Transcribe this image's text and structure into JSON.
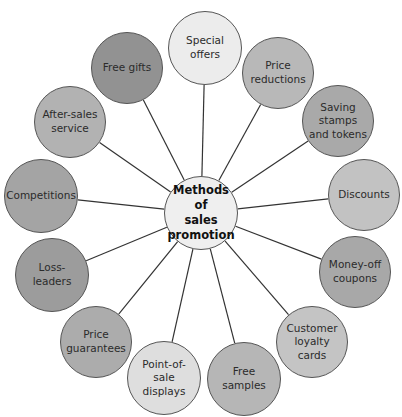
{
  "diagram": {
    "title": "Methods of sales promotion",
    "center": {
      "label": "Methods of\nsales\npromotion",
      "x": 201,
      "y": 213,
      "r": 37,
      "fill": "#efefef"
    },
    "nodes": [
      {
        "label": "Special offers",
        "x": 205,
        "y": 48,
        "r": 37,
        "fill": "#ececec"
      },
      {
        "label": "Price\nreductions",
        "x": 278,
        "y": 73,
        "r": 36,
        "fill": "#b8b8b8"
      },
      {
        "label": "Saving stamps\nand tokens",
        "x": 338,
        "y": 121,
        "r": 36,
        "fill": "#a9a9a9"
      },
      {
        "label": "Discounts",
        "x": 364,
        "y": 195,
        "r": 36,
        "fill": "#c2c2c2"
      },
      {
        "label": "Money-off\ncoupons",
        "x": 355,
        "y": 272,
        "r": 36,
        "fill": "#a8a8a8"
      },
      {
        "label": "Customer\nloyalty cards",
        "x": 312,
        "y": 342,
        "r": 36,
        "fill": "#c4c4c4"
      },
      {
        "label": "Free samples",
        "x": 244,
        "y": 379,
        "r": 37,
        "fill": "#b6b6b6"
      },
      {
        "label": "Point-of-sale\ndisplays",
        "x": 164,
        "y": 378,
        "r": 37,
        "fill": "#dedede"
      },
      {
        "label": "Price\nguarantees",
        "x": 96,
        "y": 342,
        "r": 36,
        "fill": "#acacac"
      },
      {
        "label": "Loss-leaders",
        "x": 52,
        "y": 275,
        "r": 37,
        "fill": "#9c9c9c"
      },
      {
        "label": "Competitions",
        "x": 41,
        "y": 196,
        "r": 37,
        "fill": "#a4a4a4"
      },
      {
        "label": "After-sales\nservice",
        "x": 70,
        "y": 122,
        "r": 36,
        "fill": "#b2b2b2"
      },
      {
        "label": "Free gifts",
        "x": 127,
        "y": 68,
        "r": 36,
        "fill": "#929292"
      }
    ],
    "line_color": "#333333"
  }
}
